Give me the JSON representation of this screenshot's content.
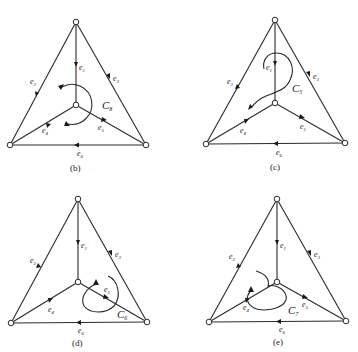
{
  "figure": {
    "panels": [
      {
        "id": "b",
        "caption": "(b)",
        "cycle": "C",
        "cycle_sub": "8",
        "edges": {
          "e1": "e",
          "e2": "e",
          "e3": "e",
          "e4": "e",
          "e5": "e",
          "e6": "e"
        },
        "subs": {
          "e1": "1",
          "e2": "2",
          "e3": "3",
          "e4": "4",
          "e5": "5",
          "e6": "6"
        }
      },
      {
        "id": "c",
        "caption": "(c)",
        "cycle": "C",
        "cycle_sub": "5",
        "subs": {
          "e1": "1",
          "e2": "2",
          "e3": "3",
          "e4": "4",
          "e5": "5",
          "e6": "6"
        }
      },
      {
        "id": "d",
        "caption": "(d)",
        "cycle": "C",
        "cycle_sub": "6",
        "subs": {
          "e1": "1",
          "e2": "2",
          "e3": "3",
          "e4": "4",
          "e5": "5",
          "e6": "6"
        }
      },
      {
        "id": "e",
        "caption": "(e)",
        "cycle": "C",
        "cycle_sub": "7",
        "subs": {
          "e1": "1",
          "e2": "2",
          "e3": "3",
          "e4": "4",
          "e5": "5",
          "e6": "6"
        }
      }
    ],
    "edge_letter": "e",
    "line_color": "#2a2a2a",
    "background": "#ffffff"
  }
}
